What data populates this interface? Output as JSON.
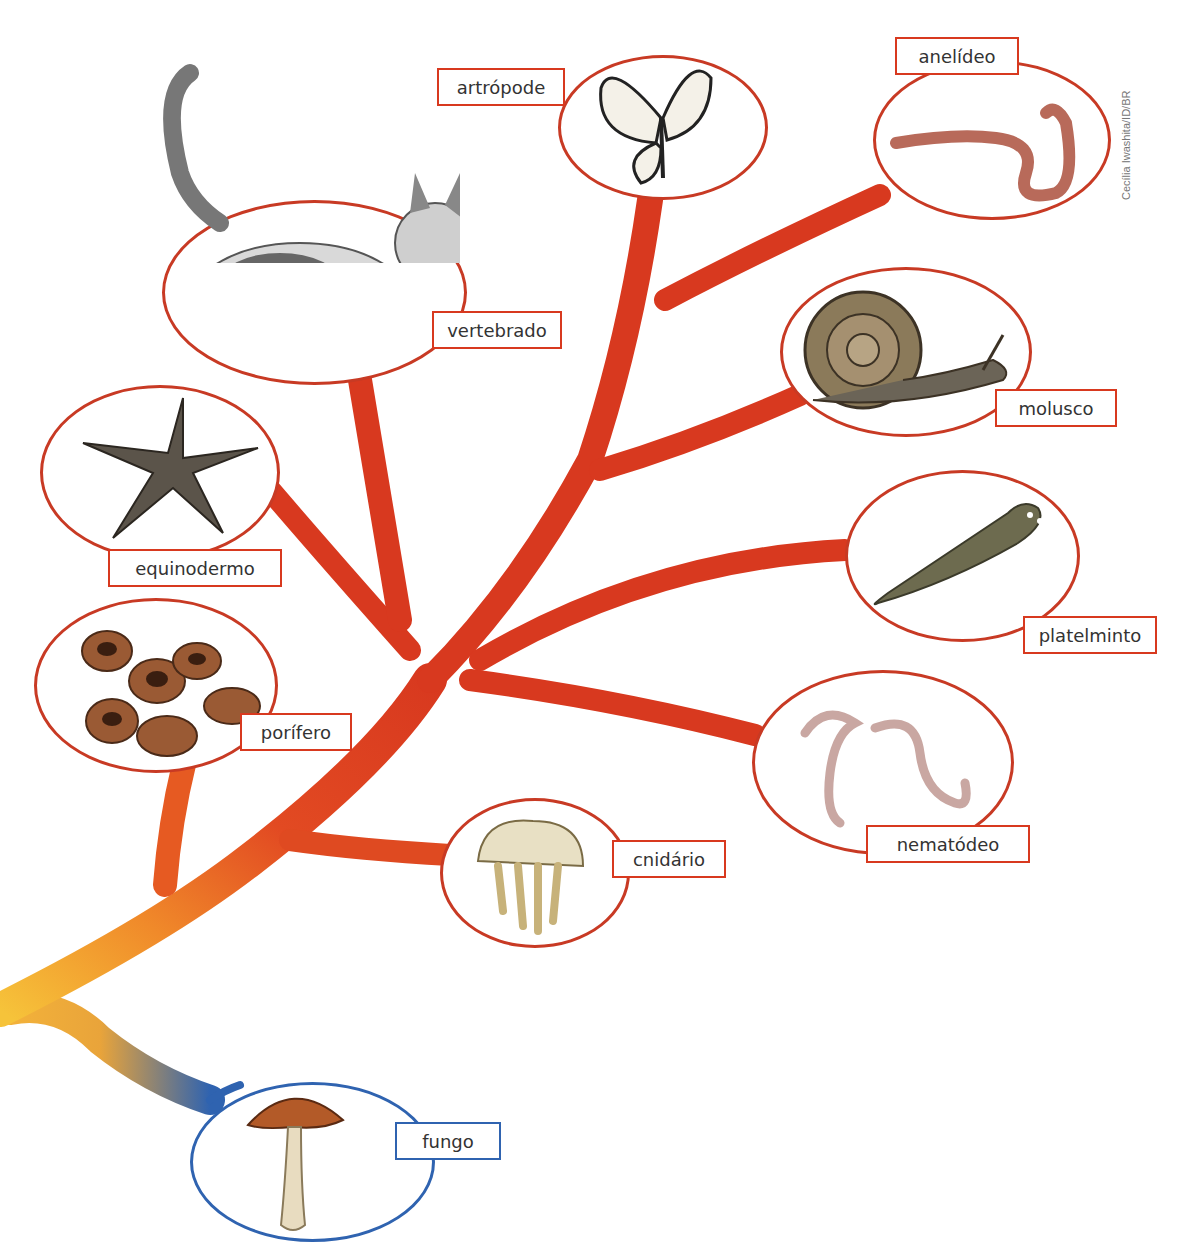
{
  "diagram": {
    "title": "",
    "type": "phylogenetic-tree",
    "colors": {
      "branch_red": "#d8391f",
      "branch_orange": "#f08a2a",
      "branch_yellow": "#f6c33a",
      "branch_blue": "#2f63b0",
      "label_border_red": "#d8391f",
      "label_border_blue": "#2f63b0"
    },
    "nodes": [
      {
        "id": "vertebrado",
        "label": "vertebrado",
        "icon": "cat-illustration"
      },
      {
        "id": "artropode",
        "label": "artrópode",
        "icon": "butterfly-illustration"
      },
      {
        "id": "anelideo",
        "label": "anelídeo",
        "icon": "earthworm-illustration"
      },
      {
        "id": "molusco",
        "label": "molusco",
        "icon": "snail-illustration"
      },
      {
        "id": "equinodermo",
        "label": "equinodermo",
        "icon": "starfish-illustration"
      },
      {
        "id": "platelminto",
        "label": "platelminto",
        "icon": "flatworm-illustration"
      },
      {
        "id": "porifero",
        "label": "porífero",
        "icon": "sponge-illustration"
      },
      {
        "id": "nematodeo",
        "label": "nematódeo",
        "icon": "roundworm-illustration"
      },
      {
        "id": "cnidario",
        "label": "cnidário",
        "icon": "jellyfish-illustration"
      },
      {
        "id": "fungo",
        "label": "fungo",
        "icon": "mushroom-illustration"
      }
    ],
    "credit": "Cecília Iwashita/ID/BR"
  }
}
